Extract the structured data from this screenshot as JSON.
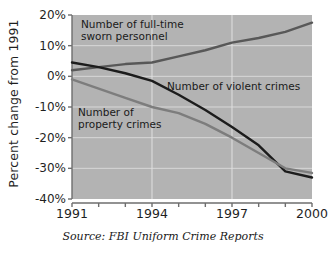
{
  "chart_data": {
    "type": "line",
    "title": "",
    "xlabel": "",
    "ylabel": "Percent change from 1991",
    "source": "Source: FBI Uniform Crime Reports",
    "x": [
      1991,
      1992,
      1993,
      1994,
      1995,
      1996,
      1997,
      1998,
      1999,
      2000
    ],
    "xlim": [
      1991,
      2000
    ],
    "ylim": [
      -40,
      20
    ],
    "xticks": [
      1991,
      1992,
      1993,
      1994,
      1995,
      1996,
      1997,
      1998,
      1999,
      2000
    ],
    "xtick_labels": [
      "1991",
      "",
      "",
      "1994",
      "",
      "",
      "1997",
      "",
      "",
      "2000"
    ],
    "yticks": [
      20,
      10,
      0,
      -10,
      -20,
      -30,
      -40
    ],
    "ytick_labels": [
      "20%",
      "10%",
      "0%",
      "-10%",
      "-20%",
      "-30%",
      "-40%"
    ],
    "grid": "vertical gridlines at 1994 and 1997; horizontal gridlines at 10%, 0%, -10%, -20%, -30%",
    "legend_position": "inline annotations on plot",
    "plot_background": "#b3b3b3",
    "series": [
      {
        "name": "Number of full-time sworn personnel",
        "color": "#585858",
        "values": [
          2,
          3,
          4,
          4.5,
          6.5,
          8.5,
          11,
          12.5,
          14.5,
          17.5
        ]
      },
      {
        "name": "Number of violent crimes",
        "color": "#1c1c1c",
        "values": [
          4.5,
          3,
          1,
          -1.5,
          -6,
          -11,
          -16.5,
          -22.5,
          -31,
          -33
        ]
      },
      {
        "name": "Number of property crimes",
        "color": "#7d7d7d",
        "values": [
          -1,
          -4,
          -7,
          -10,
          -12,
          -15.5,
          -20,
          -25,
          -30,
          -31.5
        ]
      }
    ]
  },
  "annotations": [
    {
      "id": "sworn",
      "line1": "Number of full-time",
      "line2": "sworn personnel"
    },
    {
      "id": "violent",
      "line1": "Number of violent crimes",
      "line2": ""
    },
    {
      "id": "property",
      "line1": "Number of",
      "line2": "property crimes"
    }
  ]
}
